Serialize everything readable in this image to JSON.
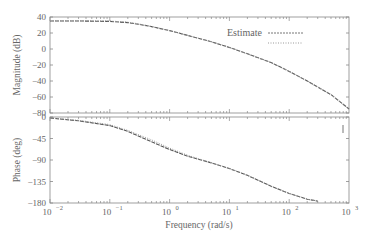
{
  "chart_data": [
    {
      "type": "line",
      "panel": "magnitude",
      "title": "",
      "xlabel": "",
      "ylabel": "Magnitude (dB)",
      "xscale": "log",
      "xlim": [
        0.01,
        1000
      ],
      "ylim": [
        -80,
        40
      ],
      "yticks": [
        40,
        20,
        0,
        -20,
        -40,
        -60,
        -80
      ],
      "ytick_labels": [
        "40",
        "20",
        "0",
        "−20",
        "−40",
        "−60",
        "−80"
      ],
      "grid": false,
      "legend": {
        "position": "upper right",
        "entries": [
          "Estimate",
          ""
        ]
      },
      "series": [
        {
          "name": "Estimate",
          "style": "dashed",
          "x": [
            0.01,
            0.03,
            0.1,
            0.2,
            0.3,
            0.5,
            1,
            2,
            5,
            10,
            20,
            50,
            100,
            200,
            500,
            1000
          ],
          "y": [
            35,
            35,
            34.5,
            33,
            31,
            28,
            23,
            17,
            9,
            2,
            -6,
            -17,
            -28,
            -40,
            -57,
            -75
          ]
        },
        {
          "name": "True",
          "style": "dotted",
          "x": [
            0.01,
            0.03,
            0.1,
            0.2,
            0.3,
            0.5,
            1,
            2,
            5,
            10,
            20,
            50,
            100,
            200,
            500,
            1000
          ],
          "y": [
            35.5,
            35.5,
            35,
            33.5,
            31.5,
            28,
            23,
            17,
            9,
            2,
            -6,
            -17,
            -28,
            -40,
            -57,
            -75
          ]
        }
      ]
    },
    {
      "type": "line",
      "panel": "phase",
      "title": "",
      "xlabel": "Frequency (rad/s)",
      "ylabel": "Phase (deg)",
      "xscale": "log",
      "xlim": [
        0.01,
        1000
      ],
      "ylim": [
        -180,
        0
      ],
      "yticks": [
        0,
        -45,
        -90,
        -135,
        -180
      ],
      "ytick_labels": [
        "0",
        "−45",
        "−90",
        "−135",
        "−180"
      ],
      "xticks": [
        0.01,
        0.1,
        1,
        10,
        100,
        1000
      ],
      "grid": false,
      "series": [
        {
          "name": "Estimate",
          "style": "dashed",
          "x": [
            0.01,
            0.03,
            0.1,
            0.2,
            0.5,
            1,
            2,
            5,
            10,
            20,
            50,
            100,
            200,
            300
          ],
          "y": [
            -2,
            -8,
            -18,
            -30,
            -52,
            -68,
            -82,
            -96,
            -108,
            -122,
            -145,
            -160,
            -172,
            -176
          ]
        },
        {
          "name": "True",
          "style": "dotted",
          "x": [
            0.01,
            0.03,
            0.1,
            0.2,
            0.5,
            1,
            2,
            5,
            10,
            20,
            50,
            100,
            200,
            300
          ],
          "y": [
            -2,
            -7,
            -16,
            -28,
            -48,
            -65,
            -80,
            -96,
            -108,
            -122,
            -145,
            -160,
            -172,
            -176
          ]
        }
      ]
    }
  ],
  "axes": {
    "magnitude_ylabel": "Magnitude (dB)",
    "phase_ylabel": "Phase (deg)",
    "xlabel": "Frequency (rad/s)",
    "x_tick_bases": [
      "10",
      "10",
      "10",
      "10",
      "10",
      "10"
    ],
    "x_tick_exps": [
      "−2",
      "−1",
      "0",
      "1",
      "2",
      "3"
    ]
  },
  "legend": {
    "estimate_label": "Estimate"
  }
}
